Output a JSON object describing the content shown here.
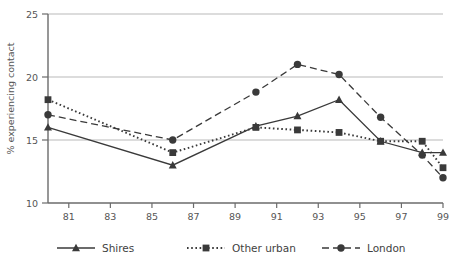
{
  "figure": {
    "cut_caption": "",
    "y_axis_title": "% experiencing contact",
    "x_axis_title": ""
  },
  "legend": {
    "position": "bottom",
    "entries": [
      {
        "label": "Shires",
        "style": "solid",
        "marker": "triangle",
        "color": "#3a3a3a"
      },
      {
        "label": "Other urban",
        "style": "dotted",
        "marker": "square",
        "color": "#3a3a3a"
      },
      {
        "label": "London",
        "style": "dashed",
        "marker": "circle",
        "color": "#3a3a3a"
      }
    ]
  },
  "chart_data": {
    "type": "line",
    "title": "",
    "xlabel": "",
    "ylabel": "% experiencing contact",
    "xlim": [
      80,
      99
    ],
    "ylim": [
      10,
      25
    ],
    "yticks": [
      10,
      15,
      20,
      25
    ],
    "xticks": [
      81,
      83,
      85,
      87,
      89,
      91,
      93,
      95,
      97,
      99
    ],
    "xtick_labels": [
      "81",
      "83",
      "85",
      "87",
      "89",
      "91",
      "93",
      "95",
      "97",
      "99"
    ],
    "ytick_labels": [
      "10",
      "15",
      "20",
      "25"
    ],
    "grid": "horizontal",
    "legend_position": "bottom",
    "x": [
      80,
      82,
      84,
      86,
      88,
      90,
      92,
      94,
      96,
      98,
      99
    ],
    "series": [
      {
        "name": "Shires",
        "marker": "triangle",
        "style": "solid",
        "x": [
          80,
          86,
          90,
          92,
          94,
          96,
          98,
          99
        ],
        "values": [
          16.0,
          13.0,
          16.1,
          16.9,
          18.2,
          14.9,
          14.0,
          14.0
        ]
      },
      {
        "name": "Other urban",
        "marker": "square",
        "style": "dotted",
        "x": [
          80,
          86,
          90,
          92,
          94,
          96,
          98,
          99
        ],
        "values": [
          18.2,
          14.0,
          16.0,
          15.8,
          15.6,
          14.9,
          14.9,
          12.8
        ]
      },
      {
        "name": "London",
        "marker": "circle",
        "style": "dashed",
        "x": [
          80,
          86,
          90,
          92,
          94,
          96,
          98,
          99
        ],
        "values": [
          17.0,
          15.0,
          18.8,
          21.0,
          20.2,
          16.8,
          13.8,
          12.0
        ]
      }
    ]
  }
}
